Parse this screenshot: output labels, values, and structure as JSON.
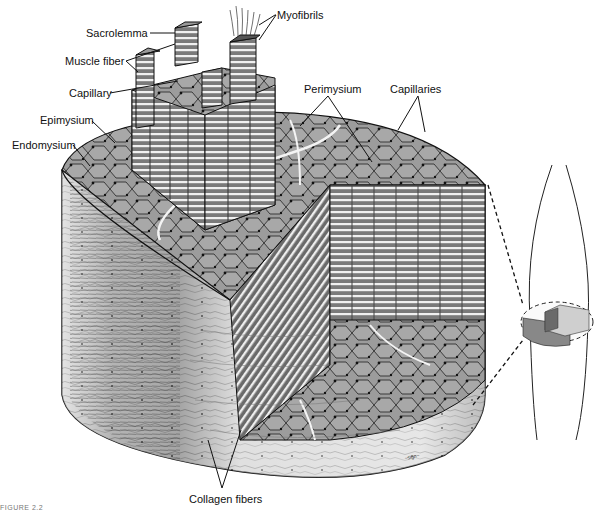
{
  "figure": {
    "caption": "FIGURE 2.2",
    "signature": "Benjamin"
  },
  "labels": {
    "sacrolemma": "Sacrolemma",
    "myofibrils": "Myofibrils",
    "muscle_fiber": "Muscle fiber",
    "capillary": "Capillary",
    "perimysium": "Perimysium",
    "capillaries": "Capillaries",
    "epimysium": "Epimysium",
    "endomysium": "Endomysium",
    "collagen_fibers": "Collagen fibers"
  },
  "colors": {
    "ink": "#111111",
    "fiber_fill": "#9a9a9a",
    "fiber_light": "#c8c8c8",
    "side_light": "#e4e4e4",
    "side_dark": "#5a5a5a",
    "background": "#ffffff"
  }
}
